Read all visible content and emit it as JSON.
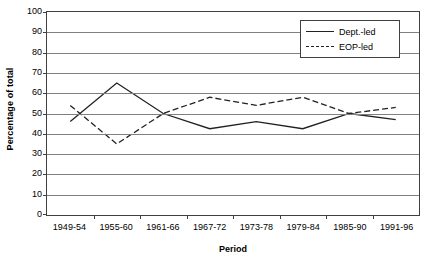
{
  "chart_data": {
    "type": "line",
    "title": "",
    "xlabel": "Period",
    "ylabel": "Percentage of total",
    "categories": [
      "1949-54",
      "1955-60",
      "1961-66",
      "1967-72",
      "1973-78",
      "1979-84",
      "1985-90",
      "1991-96"
    ],
    "yticks": [
      0,
      10,
      20,
      30,
      40,
      50,
      60,
      70,
      80,
      90,
      100
    ],
    "ylim": [
      0,
      100
    ],
    "grid": true,
    "legend_position": "top-right",
    "series": [
      {
        "name": "Dept.-led",
        "style": "solid",
        "color": "#222222",
        "values": [
          46,
          65,
          50,
          42.5,
          46,
          42.5,
          50,
          47
        ]
      },
      {
        "name": "EOP-led",
        "style": "dashed",
        "color": "#222222",
        "values": [
          54,
          35,
          50,
          58,
          54,
          58,
          50,
          53
        ]
      }
    ]
  },
  "legend": {
    "entries": [
      {
        "label": "Dept.-led"
      },
      {
        "label": "EOP-led"
      }
    ]
  },
  "axes": {
    "y_title": "Percentage of total",
    "x_title": "Period"
  }
}
